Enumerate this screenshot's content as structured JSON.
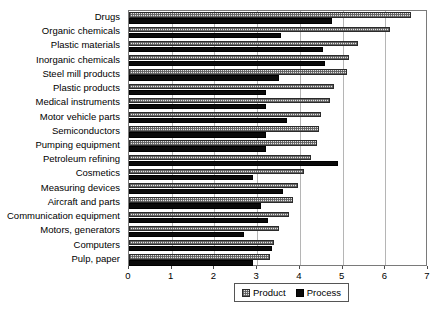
{
  "chart_data": {
    "type": "bar",
    "orientation": "horizontal",
    "title": "",
    "xlabel": "",
    "ylabel": "",
    "xlim": [
      0,
      7
    ],
    "xticks": [
      0,
      1,
      2,
      3,
      4,
      5,
      6,
      7
    ],
    "xtick_labels": [
      "0",
      "1",
      "2",
      "3",
      "4",
      "5",
      "6",
      "7"
    ],
    "grid": true,
    "grid_axis": "x",
    "legend_position": "bottom-center",
    "categories": [
      "Drugs",
      "Organic chemicals",
      "Plastic materials",
      "Inorganic chemicals",
      "Steel mill products",
      "Plastic products",
      "Medical instruments",
      "Motor vehicle parts",
      "Semiconductors",
      "Pumping equipment",
      "Petroleum refining",
      "Cosmetics",
      "Measuring devices",
      "Aircraft and parts",
      "Communication equipment",
      "Motors, generators",
      "Computers",
      "Pulp, paper"
    ],
    "series": [
      {
        "name": "Product",
        "color": "#e2e2e2",
        "pattern": "dotted",
        "values": [
          6.6,
          6.1,
          5.35,
          5.15,
          5.1,
          4.8,
          4.7,
          4.5,
          4.45,
          4.4,
          4.25,
          4.1,
          3.95,
          3.85,
          3.75,
          3.5,
          3.4,
          3.3
        ]
      },
      {
        "name": "Process",
        "color": "#0a0a0a",
        "pattern": "solid",
        "values": [
          4.75,
          3.55,
          4.55,
          4.6,
          3.5,
          3.2,
          3.2,
          3.7,
          3.2,
          3.2,
          4.9,
          2.9,
          3.6,
          3.1,
          3.25,
          2.7,
          3.35,
          2.9
        ]
      }
    ]
  },
  "legend": {
    "items": [
      {
        "label": "Product",
        "swatch": "product"
      },
      {
        "label": "Process",
        "swatch": "process"
      }
    ]
  }
}
